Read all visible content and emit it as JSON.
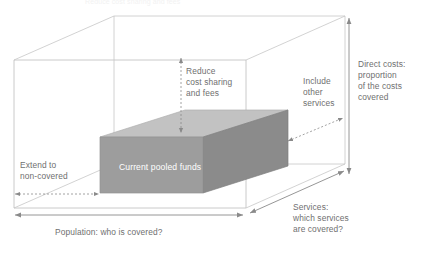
{
  "figure": {
    "type": "three-dimensional-coverage-cube-diagram",
    "top_cut_text": "Reduce cost sharing and fees",
    "core_block_label": "Current pooled funds",
    "dimensions": {
      "height_axis": {
        "name": "direct-costs",
        "label_lines": [
          "Direct costs:",
          "proportion",
          "of the costs",
          "covered"
        ],
        "expand_label_lines": [
          "Reduce",
          "cost sharing",
          "and fees"
        ]
      },
      "width_axis": {
        "name": "population",
        "label_lines": [
          "Population: who is covered?"
        ],
        "expand_label_lines": [
          "Extend to",
          "non-covered"
        ]
      },
      "depth_axis": {
        "name": "services",
        "label_lines": [
          "Services:",
          "which services",
          "are covered?"
        ],
        "expand_label_lines": [
          "Include",
          "other",
          "services"
        ]
      }
    },
    "colors": {
      "block_front": "#9e9e9e",
      "block_top": "#c0c0c0",
      "block_side": "#868686",
      "wireframe": "#b8b8b8",
      "arrow": "#8a8a8a",
      "text": "#6f6f6f",
      "block_text": "#ffffff",
      "background": "#ffffff"
    }
  }
}
